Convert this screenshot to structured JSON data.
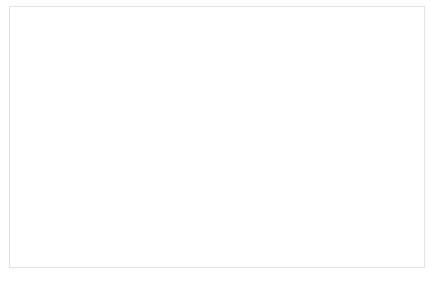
{
  "chart_data": {
    "type": "bar",
    "title": "",
    "xlabel": "",
    "ylabel": "",
    "categories": [
      "Human Health [DALY]",
      "Ecosystems [species.yr]",
      "Resources [$]"
    ],
    "series": [
      {
        "name": "Scenario 1",
        "values": [
          -65,
          -61,
          -26
        ]
      },
      {
        "name": "Scenario 2",
        "values": [
          -100,
          -100,
          -100
        ]
      }
    ],
    "ylim": [
      -100,
      0
    ],
    "ytick_labels": [
      "0%",
      "-10%",
      "-20%",
      "-30%",
      "-40%",
      "-50%",
      "-60%",
      "-70%",
      "-80%",
      "-90%",
      "-100%"
    ],
    "ytick_values": [
      0,
      -10,
      -20,
      -30,
      -40,
      -50,
      -60,
      -70,
      -80,
      -90,
      -100
    ],
    "grid": true,
    "legend_position": "bottom",
    "legend": [
      "Scenario 1",
      "Scenario 2"
    ]
  },
  "colors": {
    "gridline": "#e6e6e6",
    "axis": "#d2d2d2",
    "text": "#7d7d7d",
    "bar_outline": "#6e6e6e",
    "frame": "#e2e2e2",
    "background": "#ffffff"
  }
}
